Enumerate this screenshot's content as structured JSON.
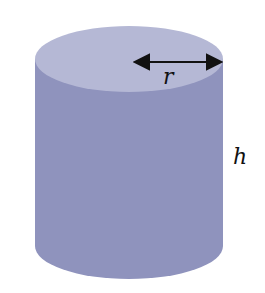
{
  "diagram": {
    "shape": "cylinder",
    "labels": {
      "radius": "r",
      "height": "h"
    },
    "colors": {
      "top": "#b5b8d5",
      "side": "#8f93bd",
      "arrow": "#111111"
    }
  }
}
